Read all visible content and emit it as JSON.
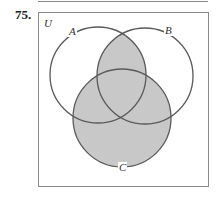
{
  "problem": {
    "number": "75."
  },
  "diagram": {
    "type": "venn-diagram",
    "universe_label": "U",
    "sets": [
      {
        "label": "A",
        "cx": 98,
        "cy": 75,
        "r": 48
      },
      {
        "label": "B",
        "cx": 145,
        "cy": 76,
        "r": 48
      },
      {
        "label": "C",
        "cx": 122,
        "cy": 118,
        "r": 49
      }
    ],
    "shaded_region": "(A ∩ B) ∪ C",
    "colors": {
      "shade": "#c8c8c8",
      "stroke": "#5a5a5a",
      "box": "#8a8a8a"
    }
  }
}
